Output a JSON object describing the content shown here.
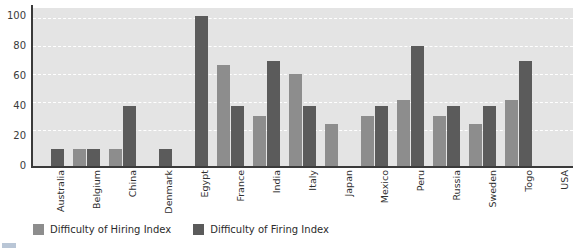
{
  "chart_data": {
    "type": "bar",
    "title": "",
    "subtitle": "",
    "xlabel": "",
    "ylabel": "",
    "ylim": [
      0,
      105
    ],
    "yticks": [
      0,
      20,
      40,
      60,
      80,
      100
    ],
    "grid": true,
    "legend_position": "bottom-left",
    "categories": [
      "Australia",
      "Belgium",
      "China",
      "Denmark",
      "Egypt",
      "France",
      "India",
      "Italy",
      "Japan",
      "Mexico",
      "Peru",
      "Russia",
      "Sweden",
      "Togo",
      "USA"
    ],
    "series": [
      {
        "name": "Difficulty of Hiring Index",
        "color": "#8d8d8d",
        "values": [
          0,
          11,
          11,
          0,
          0,
          67,
          33,
          61,
          28,
          33,
          44,
          33,
          28,
          44,
          0
        ]
      },
      {
        "name": "Difficulty of Firing Index",
        "color": "#5b5b5b",
        "values": [
          11,
          11,
          40,
          11,
          100,
          40,
          70,
          40,
          0,
          40,
          80,
          40,
          40,
          70,
          0
        ]
      }
    ]
  },
  "axis": {
    "y_tick_labels": [
      "0",
      "20",
      "40",
      "60",
      "80",
      "100"
    ]
  },
  "legend": {
    "items": [
      {
        "label": "Difficulty of Hiring Index",
        "color": "#8d8d8d"
      },
      {
        "label": "Difficulty of Firing Index",
        "color": "#5b5b5b"
      }
    ]
  },
  "colors": {
    "plot_background": "#e4e4e4",
    "gridline": "#ffffff",
    "axis": "#3a3a3a",
    "page_background": "#ffffff"
  }
}
